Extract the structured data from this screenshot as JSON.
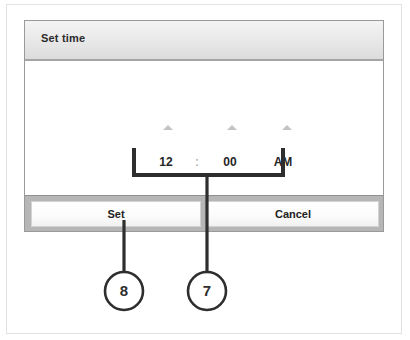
{
  "dialog": {
    "title": "Set time",
    "time_picker": {
      "hour": "12",
      "separator": ":",
      "minute": "00",
      "meridiem": "AM",
      "hour_up_icon": "chevron-up-icon",
      "minute_up_icon": "chevron-up-icon",
      "meridiem_up_icon": "chevron-up-icon",
      "hour_down_icon": "chevron-down-icon",
      "minute_down_icon": "chevron-down-icon"
    },
    "buttons": {
      "set": "Set",
      "cancel": "Cancel"
    }
  },
  "annotations": {
    "callouts": [
      {
        "number": "7",
        "target": "time-picker-down-arrows"
      },
      {
        "number": "8",
        "target": "set-button"
      }
    ]
  },
  "colors": {
    "titlebar_top": "#f3f3f3",
    "titlebar_bottom": "#dcdcdc",
    "footer_bar": "#b6b6b6",
    "dialog_border": "#9a9a9a",
    "text": "#262626",
    "arrow_gray": "#c3c3c3",
    "annotation_ink": "#2e2e2e"
  }
}
